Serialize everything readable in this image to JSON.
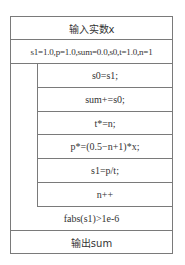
{
  "diagram": {
    "type": "nassi-shneiderman",
    "input_step": "输入实数x",
    "init_step": "s1=1.0,p=1.0,sum=0.0,s0,t=1.0,n=1",
    "loop": {
      "kind": "do-while",
      "body": [
        "s0=s1;",
        "sum+=s0;",
        "t*=n;",
        "p*=(0.5−n+1)*x;",
        "s1=p/t;",
        "n++"
      ],
      "condition": "fabs(s1)>1e-6"
    },
    "output_step": "输出sum"
  }
}
